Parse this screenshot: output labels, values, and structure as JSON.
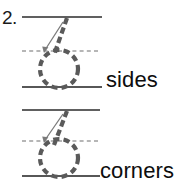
{
  "worksheet": {
    "item_number": "2.",
    "rows": [
      {
        "id": "row-sides",
        "label": "sides",
        "letter_trace": "b",
        "guide": {
          "top_line": "solid",
          "mid_line": "dashed",
          "base_line": "solid"
        },
        "stroke_arrow": "down-left-diagonal"
      },
      {
        "id": "row-corners",
        "label": "corners",
        "letter_trace": "b",
        "guide": {
          "top_line": "solid",
          "mid_line": "dashed",
          "base_line": "solid"
        },
        "stroke_arrow": "down-left-diagonal"
      }
    ]
  },
  "colors": {
    "text": "#0d0d0d",
    "guide_line": "#2b2b2b",
    "trace_stroke": "#5a5a5a",
    "arrow": "#6b6b6b",
    "background": "#ffffff"
  },
  "geometry": {
    "row1": {
      "top_line_y": 17,
      "mid_line_y": 51,
      "base_line_y": 87,
      "line_x_start": 22,
      "line_x_end": 102,
      "oval_cx": 59,
      "oval_cy": 69,
      "oval_rx": 19,
      "oval_ry": 19
    },
    "row2": {
      "top_line_y": 110,
      "mid_line_y": 141,
      "base_line_y": 176,
      "line_x_start": 22,
      "line_x_end": 100,
      "oval_cx": 59,
      "oval_cy": 158,
      "oval_rx": 19,
      "oval_ry": 19
    }
  }
}
